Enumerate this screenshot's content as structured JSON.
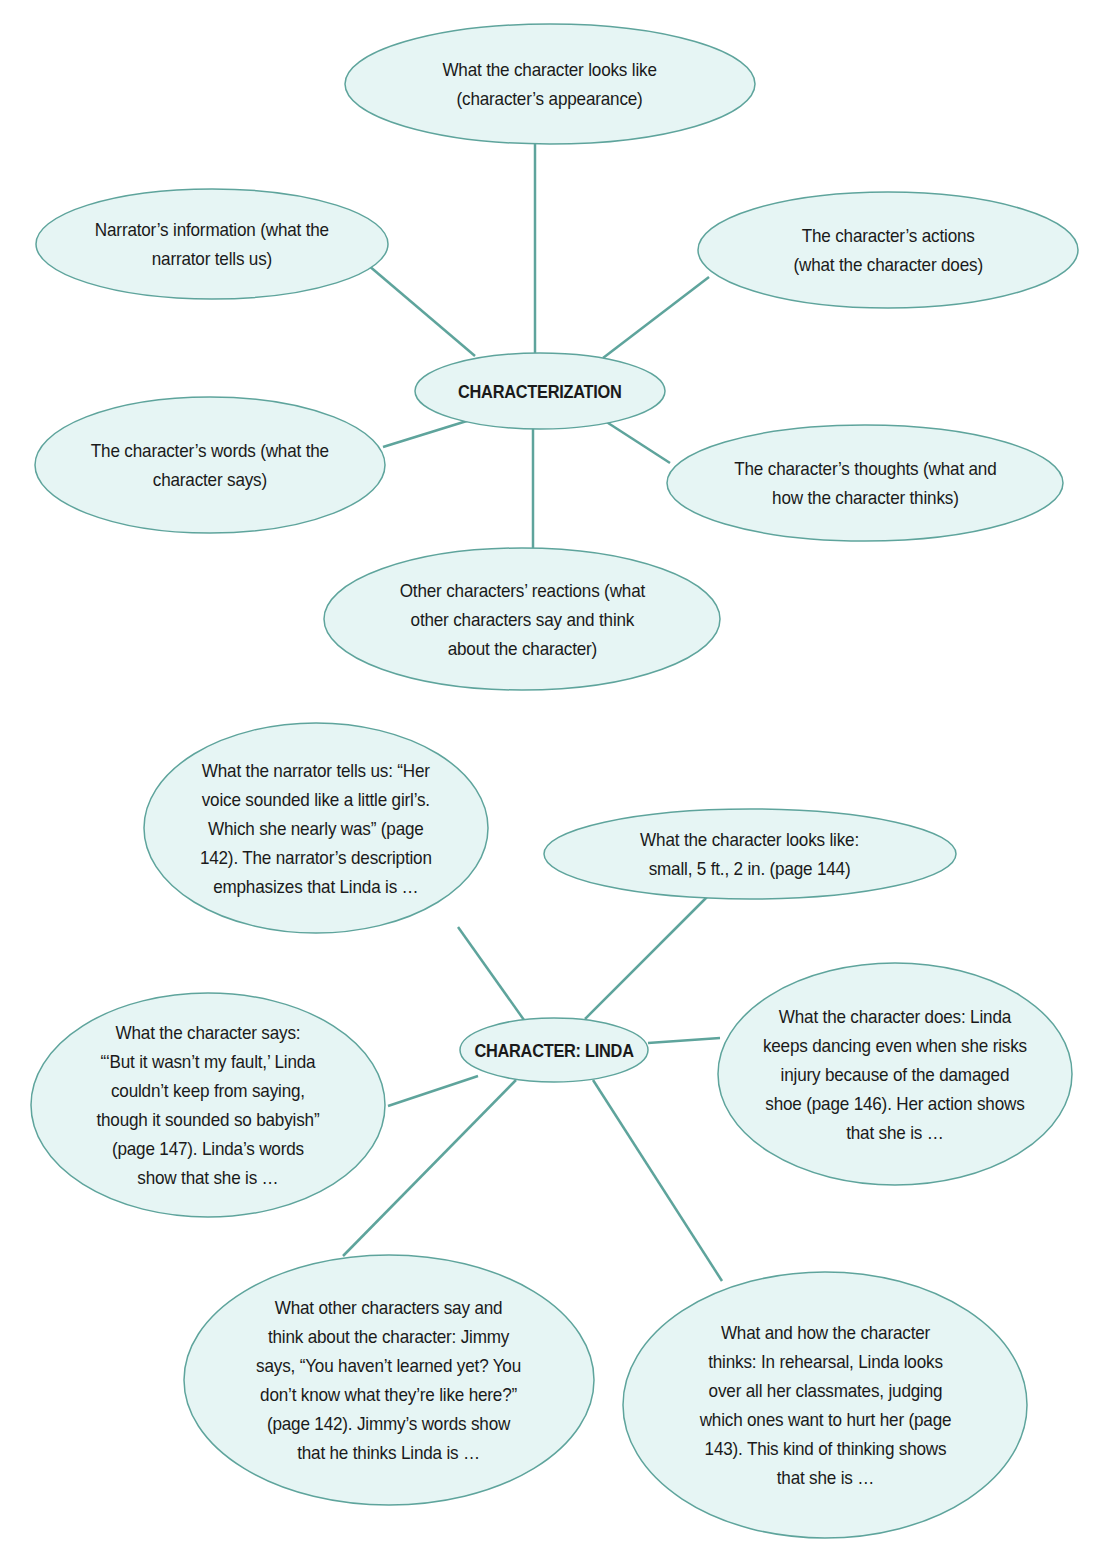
{
  "colors": {
    "bubble_fill": "#e6f5f4",
    "bubble_stroke": "#5ea49c",
    "connector": "#5ea49c",
    "text": "#1a1a1a",
    "background": "#ffffff"
  },
  "diagram_top": {
    "center": {
      "label": "CHARACTERIZATION",
      "cx": 540,
      "cy": 391,
      "rx": 125,
      "ry": 38
    },
    "nodes": [
      {
        "id": "appearance",
        "lines": [
          "What the character looks like",
          "(character’s appearance)"
        ],
        "cx": 550,
        "cy": 84,
        "rx": 205,
        "ry": 60,
        "line_from": [
          535,
          144
        ],
        "line_to": [
          535,
          353
        ]
      },
      {
        "id": "narrator",
        "lines": [
          "Narrator’s information (what the",
          "narrator tells us)"
        ],
        "cx": 212,
        "cy": 244,
        "rx": 176,
        "ry": 55,
        "line_from": [
          368,
          265
        ],
        "line_to": [
          475,
          356
        ]
      },
      {
        "id": "actions",
        "lines": [
          "The character’s actions",
          "(what the character does)"
        ],
        "cx": 888,
        "cy": 250,
        "rx": 190,
        "ry": 58,
        "line_from": [
          709,
          277
        ],
        "line_to": [
          603,
          358
        ]
      },
      {
        "id": "words",
        "lines": [
          "The character’s words (what the",
          "character says)"
        ],
        "cx": 210,
        "cy": 465,
        "rx": 175,
        "ry": 68,
        "line_from": [
          383,
          447
        ],
        "line_to": [
          470,
          420
        ]
      },
      {
        "id": "thoughts",
        "lines": [
          "The character’s thoughts (what and",
          "how the character thinks)"
        ],
        "cx": 865,
        "cy": 483,
        "rx": 198,
        "ry": 58,
        "line_from": [
          670,
          463
        ],
        "line_to": [
          605,
          421
        ]
      },
      {
        "id": "reactions",
        "lines": [
          "Other characters’ reactions (what",
          "other characters say and think",
          "about the character)"
        ],
        "cx": 522,
        "cy": 619,
        "rx": 198,
        "ry": 71,
        "line_from": [
          533,
          548
        ],
        "line_to": [
          533,
          428
        ]
      }
    ]
  },
  "diagram_bottom": {
    "center": {
      "label": "CHARACTER: LINDA",
      "cx": 554,
      "cy": 1050,
      "rx": 94,
      "ry": 32
    },
    "nodes": [
      {
        "id": "narrator-tells",
        "lines": [
          "What the narrator tells us: “Her",
          "voice sounded like a little girl’s.",
          "Which she nearly was” (page",
          "142). The narrator’s description",
          "emphasizes that Linda is …"
        ],
        "cx": 316,
        "cy": 828,
        "rx": 172,
        "ry": 105,
        "line_from": [
          458,
          927
        ],
        "line_to": [
          524,
          1020
        ]
      },
      {
        "id": "looks-like",
        "lines": [
          "What the character looks like:",
          "small, 5 ft., 2 in. (page 144)"
        ],
        "cx": 750,
        "cy": 854,
        "rx": 206,
        "ry": 45,
        "line_from": [
          707,
          897
        ],
        "line_to": [
          585,
          1019
        ]
      },
      {
        "id": "says",
        "lines": [
          "What the character says:",
          "“‘But it wasn’t my fault,’ Linda",
          "couldn’t keep from saying,",
          "though it sounded so babyish”",
          "(page 147). Linda’s words",
          "show that she is …"
        ],
        "cx": 208,
        "cy": 1105,
        "rx": 177,
        "ry": 112,
        "line_from": [
          388,
          1106
        ],
        "line_to": [
          478,
          1076
        ]
      },
      {
        "id": "does",
        "lines": [
          "What the character does: Linda",
          "keeps dancing even when she risks",
          "injury because of the damaged",
          "shoe (page 146). Her action shows",
          "that she is …"
        ],
        "cx": 895,
        "cy": 1074,
        "rx": 177,
        "ry": 111,
        "line_from": [
          720,
          1038
        ],
        "line_to": [
          648,
          1043
        ]
      },
      {
        "id": "others-say",
        "lines": [
          "What other characters say and",
          "think about the character: Jimmy",
          "says, “You haven’t learned yet? You",
          "don’t know what they’re like here?”",
          "(page 142). Jimmy’s words show",
          "that he thinks Linda is …"
        ],
        "cx": 389,
        "cy": 1380,
        "rx": 205,
        "ry": 125,
        "line_from": [
          343,
          1256
        ],
        "line_to": [
          516,
          1080
        ]
      },
      {
        "id": "thinks",
        "lines": [
          "What and how the character",
          "thinks: In rehearsal, Linda looks",
          "over all her classmates, judging",
          "which ones want to hurt her (page",
          "143). This kind of thinking shows",
          "that she is …"
        ],
        "cx": 825,
        "cy": 1405,
        "rx": 202,
        "ry": 133,
        "line_from": [
          722,
          1281
        ],
        "line_to": [
          593,
          1080
        ]
      }
    ]
  }
}
